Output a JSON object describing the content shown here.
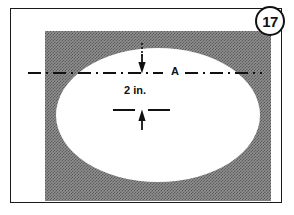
{
  "figure": {
    "number_label": "17",
    "centerline_label": "A",
    "dimension_label": "2 in.",
    "colors": {
      "frame": "#1a1a1a",
      "panel_gray": "#8f8f8f",
      "part_white": "#ffffff",
      "line_black": "#111111"
    }
  },
  "drawing": {
    "shape_name": "ellipse",
    "panel_name": "shaded-background-panel",
    "centerline_name": "horizontal-centerline",
    "dimension_name": "vertical-dimension-2in",
    "arrows": [
      {
        "name": "dimension-arrow-top",
        "direction": "down"
      },
      {
        "name": "dimension-arrow-bottom",
        "direction": "up"
      }
    ],
    "reference_line_name": "lower-reference-dashed-line"
  }
}
